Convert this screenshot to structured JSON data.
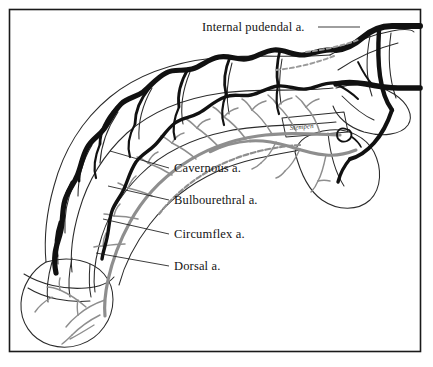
{
  "figure": {
    "kind": "anatomical-illustration",
    "frame": {
      "stroke_color": "#1a1a1a",
      "background": "#ffffff"
    },
    "signature": "Stempen"
  },
  "labels": [
    {
      "id": "internal-pudendal",
      "text": "Internal pudendal a.",
      "x": 202,
      "y": 31,
      "anchor": "start",
      "leader": "M 318 27 L 360 27"
    },
    {
      "id": "cavernous",
      "text": "Cavernous a.",
      "x": 174,
      "y": 172,
      "anchor": "start",
      "leader": "M 169 168 L 110 151"
    },
    {
      "id": "bulbourethral",
      "text": "Bulbourethral a.",
      "x": 174,
      "y": 204,
      "anchor": "start",
      "leader": "M 169 200 L 108 186"
    },
    {
      "id": "circumflex",
      "text": "Circumflex a.",
      "x": 174,
      "y": 238,
      "anchor": "start",
      "leader": "M 169 234 L 103 219"
    },
    {
      "id": "dorsal",
      "text": "Dorsal a.",
      "x": 174,
      "y": 270,
      "anchor": "start",
      "leader": "M 169 266 L 96 253"
    }
  ],
  "colors": {
    "ink": "#141414",
    "outline": "#2b2b2b",
    "artery_black": "#111111",
    "artery_gray": "#8e8e8e",
    "artery_gray_light": "#a8a8a8",
    "frame": "#1a1a1a",
    "paper": "#ffffff"
  },
  "structures": [
    {
      "id": "dorsal-artery",
      "style": "thick-black-serpentine"
    },
    {
      "id": "circumflex-arteries",
      "style": "black-branching"
    },
    {
      "id": "cavernous-artery",
      "style": "gray-axial"
    },
    {
      "id": "bulbourethral-artery",
      "style": "gray-branching"
    },
    {
      "id": "internal-pudendal-artery",
      "style": "thick-black-trunk"
    },
    {
      "id": "glans",
      "style": "outline-oval"
    },
    {
      "id": "bulb",
      "style": "outline-lobe"
    },
    {
      "id": "shaft-outline",
      "style": "outline-curve"
    }
  ]
}
